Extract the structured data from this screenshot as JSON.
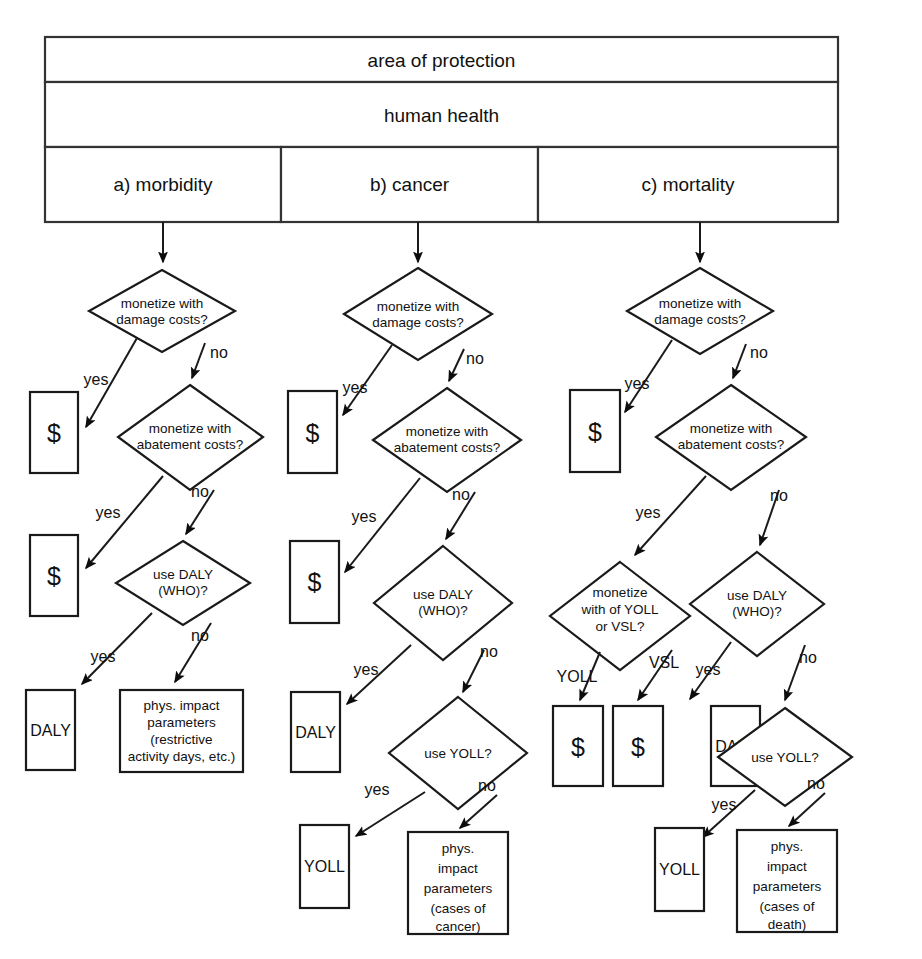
{
  "figure": {
    "title": "area of protection",
    "subtitle": "human health",
    "categories": [
      {
        "id": "a",
        "label": "a) morbidity"
      },
      {
        "id": "b",
        "label": "b) cancer"
      },
      {
        "id": "c",
        "label": "c) mortality"
      }
    ]
  },
  "labels": {
    "yes": "yes",
    "no": "no",
    "yoll_edge": "YOLL",
    "vsl_edge": "VSL"
  },
  "nodes": {
    "q_damage_l1": "monetize with",
    "q_damage_l2": "damage costs?",
    "q_abate_l1": "monetize with",
    "q_abate_l2": "abatement costs?",
    "q_daly_l1": "use DALY",
    "q_daly_l2": "(WHO)?",
    "q_yoll": "use YOLL?",
    "q_yollvsl_l1": "monetize",
    "q_yollvsl_l2": "with of YOLL",
    "q_yollvsl_l3": "or VSL?",
    "money": "$",
    "daly": "DALY",
    "yoll": "YOLL",
    "phys_morbidity": [
      "phys. impact",
      "parameters",
      "(restrictive",
      "activity days, etc.)"
    ],
    "phys_cancer": [
      "phys.",
      "impact",
      "parameters",
      "(cases of",
      "cancer)"
    ],
    "phys_mortality": [
      "phys.",
      "impact",
      "parameters",
      "(cases of",
      "death)"
    ]
  },
  "colors": {
    "stroke": "#1a1a1a",
    "fill": "#ffffff",
    "text": "#111111"
  }
}
